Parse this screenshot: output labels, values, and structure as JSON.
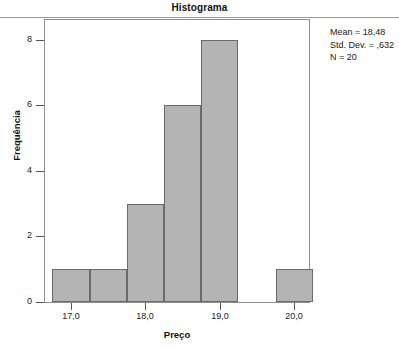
{
  "chart_data": {
    "type": "bar",
    "title": "Histograma",
    "xlabel": "Preço",
    "ylabel": "Frequência",
    "xlim": [
      16.65,
      20.2
    ],
    "ylim": [
      0,
      8.6
    ],
    "grid": false,
    "legend": null,
    "bin_width": 0.5,
    "bins": [
      {
        "start": 16.75,
        "end": 17.25,
        "value": 1
      },
      {
        "start": 17.25,
        "end": 17.75,
        "value": 1
      },
      {
        "start": 17.75,
        "end": 18.25,
        "value": 3
      },
      {
        "start": 18.25,
        "end": 18.75,
        "value": 6
      },
      {
        "start": 18.75,
        "end": 19.25,
        "value": 8
      },
      {
        "start": 19.75,
        "end": 20.25,
        "value": 1
      }
    ],
    "categories": [
      "16,75-17,25",
      "17,25-17,75",
      "17,75-18,25",
      "18,25-18,75",
      "18,75-19,25",
      "19,75-20,25"
    ],
    "values": [
      1,
      1,
      3,
      6,
      8,
      1
    ],
    "x_ticks": [
      {
        "value": 17.0,
        "label": "17,0"
      },
      {
        "value": 18.0,
        "label": "18,0"
      },
      {
        "value": 19.0,
        "label": "19,0"
      },
      {
        "value": 20.0,
        "label": "20,0"
      }
    ],
    "y_ticks": [
      {
        "value": 0,
        "label": "0"
      },
      {
        "value": 2,
        "label": "2"
      },
      {
        "value": 4,
        "label": "4"
      },
      {
        "value": 6,
        "label": "6"
      },
      {
        "value": 8,
        "label": "8"
      }
    ],
    "annotations": {
      "mean": "Mean = 18,48",
      "std_dev": "Std. Dev. = ,632",
      "n": "N = 20"
    },
    "colors": {
      "bar_fill": "#b4b4b4",
      "bar_border": "#6a6a6a",
      "frame": "#8d8d8d",
      "text": "#1a1a1a"
    }
  }
}
